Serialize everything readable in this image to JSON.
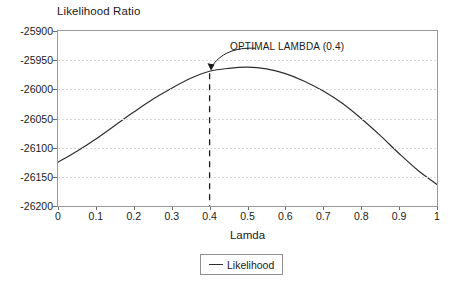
{
  "chart_data": {
    "type": "line",
    "title": "Likelihood Ratio",
    "xlabel": "Lamda",
    "ylabel": "",
    "grid": true,
    "legend_position": "bottom-center",
    "xlim": [
      0,
      1
    ],
    "ylim": [
      -26200,
      -25900
    ],
    "xticks": [
      "0",
      "0.1",
      "0.2",
      "0.3",
      "0.4",
      "0.5",
      "0.6",
      "0.7",
      "0.8",
      "0.9",
      "1"
    ],
    "xtick_values": [
      0,
      0.1,
      0.2,
      0.3,
      0.4,
      0.5,
      0.6,
      0.7,
      0.8,
      0.9,
      1
    ],
    "yticks": [
      "-25900",
      "-25950",
      "-26000",
      "-26050",
      "-26100",
      "-26150",
      "-26200"
    ],
    "ytick_values": [
      -25900,
      -25950,
      -26000,
      -26050,
      -26100,
      -26150,
      -26200
    ],
    "series": [
      {
        "name": "Likelihood",
        "color": "#2e2e2e",
        "x": [
          0,
          0.05,
          0.1,
          0.15,
          0.2,
          0.25,
          0.3,
          0.35,
          0.4,
          0.45,
          0.5,
          0.55,
          0.6,
          0.65,
          0.7,
          0.75,
          0.8,
          0.85,
          0.9,
          0.95,
          1
        ],
        "values": [
          -26125,
          -26106,
          -26085,
          -26062,
          -26039,
          -26017,
          -25998,
          -25981,
          -25969,
          -25964,
          -25962,
          -25965,
          -25973,
          -25986,
          -26003,
          -26024,
          -26050,
          -26079,
          -26110,
          -26139,
          -26163
        ]
      }
    ],
    "annotations": [
      {
        "name": "optimal-lambda",
        "text": "OPTIMAL LAMBDA (0.4)",
        "x": 0.4,
        "y": -25969,
        "marker": "vertical-dashed-line"
      }
    ]
  },
  "legend": {
    "entries": [
      {
        "label": "Likelihood"
      }
    ]
  }
}
